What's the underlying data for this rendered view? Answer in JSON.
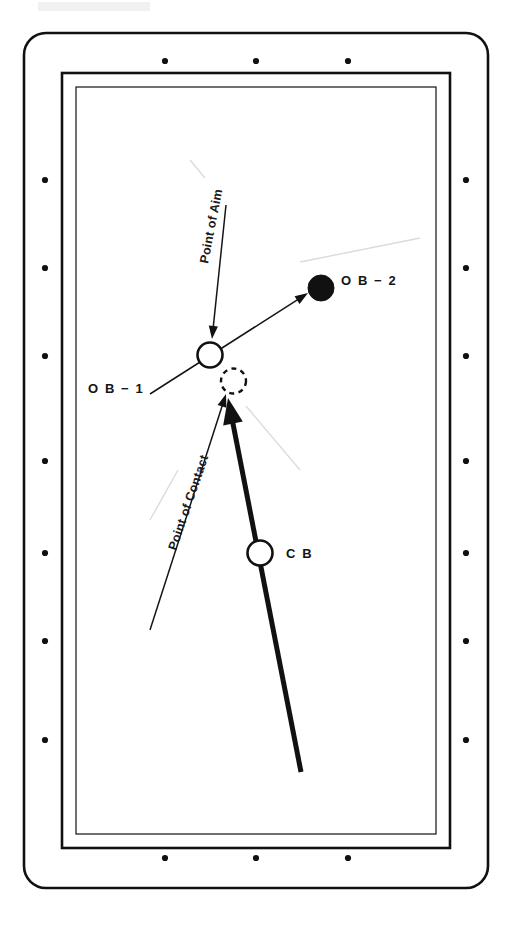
{
  "diagram": {
    "table": {
      "surface_color": "#ffffff",
      "line_color": "#111111",
      "outer_rail": {
        "x": 24,
        "y": 33,
        "width": 464,
        "height": 855,
        "corner_radius": 22,
        "stroke_width": 2.6
      },
      "middle_rail": {
        "x": 62,
        "y": 73,
        "width": 388,
        "height": 775,
        "stroke_width": 2.6
      },
      "inner_rail": {
        "x": 76,
        "y": 87,
        "width": 360,
        "height": 747,
        "stroke_width": 1.2
      },
      "diamonds": {
        "name": "rail-sight-diamond",
        "radius": 3.1,
        "top": [
          {
            "x": 165,
            "y": 61
          },
          {
            "x": 256,
            "y": 61
          },
          {
            "x": 348,
            "y": 61
          }
        ],
        "bottom": [
          {
            "x": 165,
            "y": 858
          },
          {
            "x": 256,
            "y": 858
          },
          {
            "x": 348,
            "y": 858
          }
        ],
        "left": [
          {
            "x": 45,
            "y": 180
          },
          {
            "x": 45,
            "y": 268
          },
          {
            "x": 45,
            "y": 356
          },
          {
            "x": 45,
            "y": 461
          },
          {
            "x": 45,
            "y": 553
          },
          {
            "x": 45,
            "y": 641
          },
          {
            "x": 45,
            "y": 740
          }
        ],
        "right": [
          {
            "x": 466,
            "y": 180
          },
          {
            "x": 466,
            "y": 268
          },
          {
            "x": 466,
            "y": 356
          },
          {
            "x": 466,
            "y": 461
          },
          {
            "x": 466,
            "y": 553
          },
          {
            "x": 466,
            "y": 641
          },
          {
            "x": 466,
            "y": 740
          }
        ]
      }
    },
    "balls": [
      {
        "id": "ob1",
        "name": "object-ball-1",
        "style": "open",
        "cx": 210,
        "cy": 355,
        "r": 12.5,
        "label": "O B − 1",
        "label_x": 88,
        "label_y": 393
      },
      {
        "id": "ghost",
        "name": "ghost-ball",
        "style": "dashed",
        "cx": 233.5,
        "cy": 381,
        "r": 12.5,
        "label": "",
        "label_x": 0,
        "label_y": 0
      },
      {
        "id": "ob2",
        "name": "object-ball-2",
        "style": "solid",
        "cx": 321,
        "cy": 288,
        "r": 13,
        "label": "O B − 2",
        "label_x": 341,
        "label_y": 285
      },
      {
        "id": "cb",
        "name": "cue-ball",
        "style": "open",
        "cx": 260,
        "cy": 553,
        "r": 12.5,
        "label": "C B",
        "label_x": 286,
        "label_y": 558
      }
    ],
    "lines": [
      {
        "name": "point-of-aim-line",
        "kind": "thin-arrow",
        "x1": 226,
        "y1": 205,
        "x2": 212,
        "y2": 339
      },
      {
        "name": "ob1-to-ob2-line",
        "kind": "thin-arrow",
        "x1": 150,
        "y1": 394,
        "x2": 308,
        "y2": 293
      },
      {
        "name": "point-of-contact-line",
        "kind": "thin-arrow",
        "x1": 150,
        "y1": 630,
        "x2": 226,
        "y2": 394
      },
      {
        "name": "cue-ball-path",
        "kind": "thick-arrow",
        "x1": 301,
        "y1": 772,
        "x2": 228,
        "y2": 398
      }
    ],
    "text_labels": [
      {
        "name": "point-of-aim-label",
        "text": "Point of Aim",
        "x": 208,
        "y": 264,
        "rotate": -79
      },
      {
        "name": "point-of-contact-label",
        "text": "Point of Contact",
        "x": 176,
        "y": 551,
        "rotate": -71
      }
    ]
  }
}
